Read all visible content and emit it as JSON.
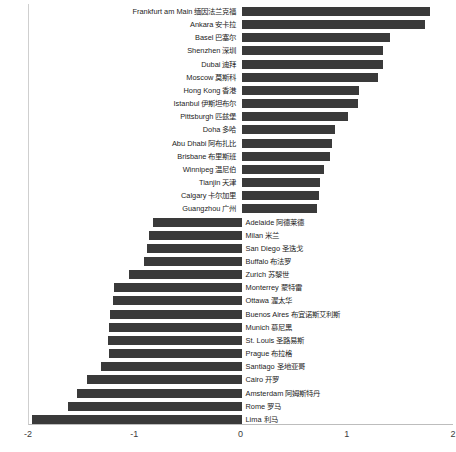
{
  "chart_data": {
    "type": "bar",
    "orientation": "horizontal",
    "title": "",
    "xlabel": "",
    "ylabel": "",
    "xlim": [
      -2,
      2
    ],
    "xticks": [
      -2,
      -1,
      0,
      1,
      2
    ],
    "xticklabels": [
      "-2",
      "-1",
      "0",
      "1",
      "2"
    ],
    "grid": false,
    "legend": null,
    "bar_color": "#3a3a3a",
    "axis_color": "#bdbdbd",
    "background": "#ffffff",
    "categories": [
      "Frankfurt am Main 缅因法兰克福",
      "Ankara 安卡拉",
      "Basel 巴塞尔",
      "Shenzhen 深圳",
      "Dubai 迪拜",
      "Moscow 莫斯科",
      "Hong Kong 香港",
      "Istanbul 伊斯坦布尔",
      "Pittsburgh 匹兹堡",
      "Doha 多哈",
      "Abu Dhabi 阿布扎比",
      "Brisbane 布里斯班",
      "Winnipeg 温尼伯",
      "Tianjin 天津",
      "Calgary 卡尔加里",
      "Guangzhou 广州",
      "Adelaide 阿德莱德",
      "Milan 米兰",
      "San Diego 圣迭戈",
      "Buffalo 布法罗",
      "Zurich 苏黎世",
      "Monterrey 蒙特雷",
      "Ottawa 渥太华",
      "Buenos Aires 布宜诺斯艾利斯",
      "Munich 慕尼黑",
      "St. Louis 圣路易斯",
      "Prague 布拉格",
      "Santiago 圣地亚哥",
      "Cairo 开罗",
      "Amsterdam 阿姆斯特丹",
      "Rome 罗马",
      "Lima 利马"
    ],
    "values": [
      1.77,
      1.73,
      1.4,
      1.33,
      1.33,
      1.28,
      1.11,
      1.1,
      1.0,
      0.88,
      0.85,
      0.83,
      0.78,
      0.74,
      0.73,
      0.71,
      -0.83,
      -0.87,
      -0.89,
      -0.92,
      -1.06,
      -1.2,
      -1.21,
      -1.24,
      -1.25,
      -1.26,
      -1.25,
      -1.32,
      -1.45,
      -1.55,
      -1.63,
      -1.97
    ]
  }
}
